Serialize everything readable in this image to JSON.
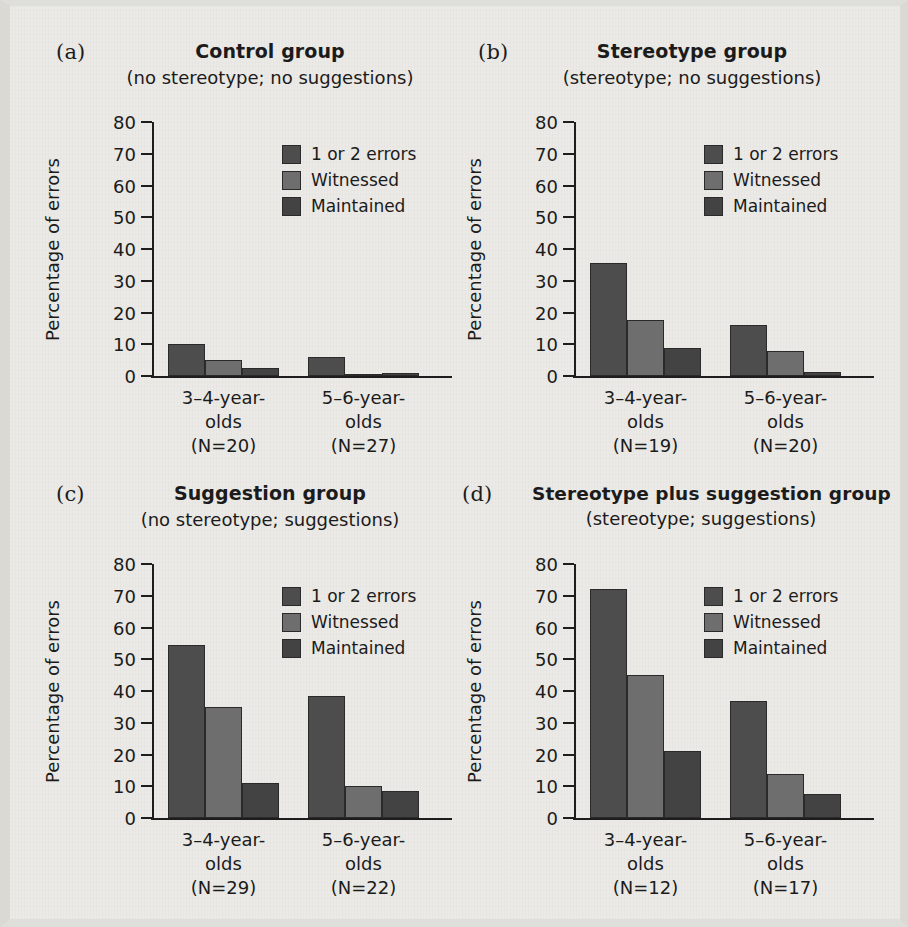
{
  "figure": {
    "y_axis_title": "Percentage of errors",
    "y_ticks": [
      "80",
      "70",
      "60",
      "50",
      "40",
      "30",
      "20",
      "10",
      "0"
    ],
    "ylim": [
      0,
      80
    ],
    "series_names": [
      "1 or 2 errors",
      "Witnessed",
      "Maintained"
    ],
    "colors": {
      "one_or_two_errors": "#4d4d4d",
      "witnessed": "#6e6e6e",
      "maintained": "#434343",
      "axis": "#1d1d1d",
      "background": "#eceae6",
      "text": "#1b1b1b"
    }
  },
  "panels": [
    {
      "letter": "(a)",
      "title": "Control group",
      "subtitle": "(no stereotype; no suggestions)",
      "groups": [
        {
          "label_line1": "3–4-year-",
          "label_line2": "olds",
          "label_line3": "(N=20)",
          "values": [
            10,
            5,
            2.5
          ]
        },
        {
          "label_line1": "5–6-year-",
          "label_line2": "olds",
          "label_line3": "(N=27)",
          "values": [
            6,
            0.5,
            1
          ]
        }
      ]
    },
    {
      "letter": "(b)",
      "title": "Stereotype group",
      "subtitle": "(stereotype; no suggestions)",
      "groups": [
        {
          "label_line1": "3–4-year-",
          "label_line2": "olds",
          "label_line3": "(N=19)",
          "values": [
            35.5,
            17.5,
            8.7
          ]
        },
        {
          "label_line1": "5–6-year-",
          "label_line2": "olds",
          "label_line3": "(N=20)",
          "values": [
            16,
            8,
            1.2
          ]
        }
      ]
    },
    {
      "letter": "(c)",
      "title": "Suggestion group",
      "subtitle": "(no stereotype; suggestions)",
      "groups": [
        {
          "label_line1": "3–4-year-",
          "label_line2": "olds",
          "label_line3": "(N=29)",
          "values": [
            54.5,
            35,
            11
          ]
        },
        {
          "label_line1": "5–6-year-",
          "label_line2": "olds",
          "label_line3": "(N=22)",
          "values": [
            38.5,
            10,
            8.5
          ]
        }
      ]
    },
    {
      "letter": "(d)",
      "title": "Stereotype plus suggestion group",
      "subtitle": "(stereotype; suggestions)",
      "groups": [
        {
          "label_line1": "3–4-year-",
          "label_line2": "olds",
          "label_line3": "(N=12)",
          "values": [
            72,
            45,
            21
          ]
        },
        {
          "label_line1": "5–6-year-",
          "label_line2": "olds",
          "label_line3": "(N=17)",
          "values": [
            37,
            14,
            7.5
          ]
        }
      ]
    }
  ],
  "chart_data": {
    "type": "bar",
    "xlabel": "",
    "ylabel": "Percentage of errors",
    "ylim": [
      0,
      80
    ],
    "ytick_step": 10,
    "grid": false,
    "legend_position": "upper right inside each panel",
    "series_names": [
      "1 or 2 errors",
      "Witnessed",
      "Maintained"
    ],
    "panels": [
      {
        "panel": "(a)",
        "title": "Control group",
        "subtitle": "(no stereotype; no suggestions)",
        "categories": [
          "3–4-year-olds (N=20)",
          "5–6-year-olds (N=27)"
        ],
        "series": [
          {
            "name": "1 or 2 errors",
            "values": [
              10,
              6
            ]
          },
          {
            "name": "Witnessed",
            "values": [
              5,
              0.5
            ]
          },
          {
            "name": "Maintained",
            "values": [
              2.5,
              1
            ]
          }
        ]
      },
      {
        "panel": "(b)",
        "title": "Stereotype group",
        "subtitle": "(stereotype; no suggestions)",
        "categories": [
          "3–4-year-olds (N=19)",
          "5–6-year-olds (N=20)"
        ],
        "series": [
          {
            "name": "1 or 2 errors",
            "values": [
              35.5,
              16
            ]
          },
          {
            "name": "Witnessed",
            "values": [
              17.5,
              8
            ]
          },
          {
            "name": "Maintained",
            "values": [
              8.7,
              1.2
            ]
          }
        ]
      },
      {
        "panel": "(c)",
        "title": "Suggestion group",
        "subtitle": "(no stereotype; suggestions)",
        "categories": [
          "3–4-year-olds (N=29)",
          "5–6-year-olds (N=22)"
        ],
        "series": [
          {
            "name": "1 or 2 errors",
            "values": [
              54.5,
              38.5
            ]
          },
          {
            "name": "Witnessed",
            "values": [
              35,
              10
            ]
          },
          {
            "name": "Maintained",
            "values": [
              11,
              8.5
            ]
          }
        ]
      },
      {
        "panel": "(d)",
        "title": "Stereotype plus suggestion group",
        "subtitle": "(stereotype; suggestions)",
        "categories": [
          "3–4-year-olds (N=12)",
          "5–6-year-olds (N=17)"
        ],
        "series": [
          {
            "name": "1 or 2 errors",
            "values": [
              72,
              37
            ]
          },
          {
            "name": "Witnessed",
            "values": [
              45,
              14
            ]
          },
          {
            "name": "Maintained",
            "values": [
              21,
              7.5
            ]
          }
        ]
      }
    ]
  }
}
